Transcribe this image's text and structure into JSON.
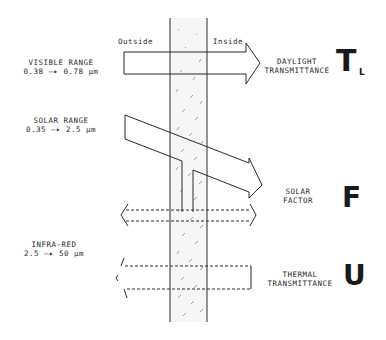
{
  "diagram": {
    "sides": {
      "outside": "Outside",
      "inside": "Inside"
    },
    "inputs": [
      {
        "label": "VISIBLE RANGE",
        "range": "0.38 —▸ 0.78 μm"
      },
      {
        "label": "SOLAR RANGE",
        "range": "0.35 —▸ 2.5 μm"
      },
      {
        "label": "INFRA-RED",
        "range": "2.5 —▸ 50 μm"
      }
    ],
    "outputs": [
      {
        "line1": "DAYLIGHT",
        "line2": "TRANSMITTANCE",
        "symbol": "T",
        "subscript": "L"
      },
      {
        "line1": "SOLAR",
        "line2": "FACTOR",
        "symbol": "F"
      },
      {
        "line1": "THERMAL",
        "line2": "TRANSMITTANCE",
        "symbol": "U"
      }
    ],
    "colors": {
      "stroke": "#2a2a2a",
      "glass_fill": "#f4f4f4",
      "text": "#2a2a2a"
    }
  }
}
